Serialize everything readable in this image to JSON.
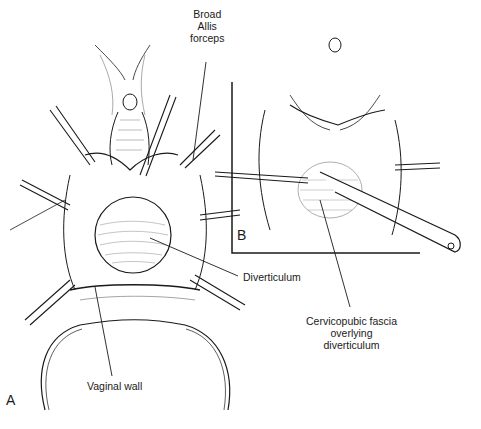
{
  "figure": {
    "panels": [
      {
        "id": "A",
        "letter": "A"
      },
      {
        "id": "B",
        "letter": "B"
      }
    ],
    "labels": {
      "forceps_line1": "Broad",
      "forceps_line2": "Allis",
      "forceps_line3": "forceps",
      "diverticulum": "Diverticulum",
      "vaginal_wall": "Vaginal wall",
      "fascia_line1": "Cervicopubic fascia",
      "fascia_line2": "overlying",
      "fascia_line3": "diverticulum"
    }
  }
}
